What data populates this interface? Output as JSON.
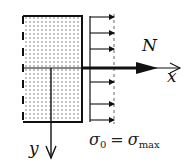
{
  "diagram": {
    "type": "stress-distribution",
    "labels": {
      "force": "N",
      "x_axis": "x",
      "y_axis": "y"
    },
    "formula": {
      "lhs_symbol": "σ",
      "lhs_sub": "0",
      "equals": "=",
      "rhs_symbol": "σ",
      "rhs_sub": "max"
    },
    "stress_arrows_count": 7,
    "colors": {
      "stroke": "#111111",
      "hatch_dots": "#555555",
      "background": "#ffffff"
    }
  }
}
